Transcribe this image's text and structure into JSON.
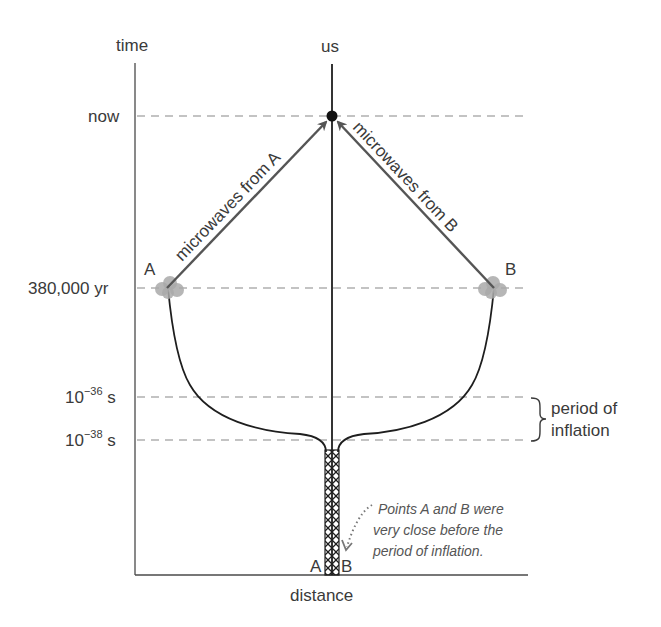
{
  "axes": {
    "y_label": "time",
    "x_label": "distance",
    "observer_label": "us"
  },
  "time_levels": [
    {
      "id": "now",
      "label": "now",
      "y": 116
    },
    {
      "id": "recombination",
      "label": "380,000 yr",
      "y": 288
    },
    {
      "id": "inflation_end",
      "label_base": "10",
      "label_exp": "−36",
      "label_unit": " s",
      "y": 397
    },
    {
      "id": "inflation_start",
      "label_base": "10",
      "label_exp": "−38",
      "label_unit": " s",
      "y": 440
    }
  ],
  "points": {
    "a_label": "A",
    "b_label": "B",
    "a_bottom_label": "A",
    "b_bottom_label": "B"
  },
  "rays": {
    "from_a": "microwaves from A",
    "from_b": "microwaves from B"
  },
  "bracket": {
    "line1": "period of",
    "line2": "inflation"
  },
  "annotation": {
    "line1": "Points A and B were",
    "line2": "very close before the",
    "line3": "period of inflation."
  },
  "colors": {
    "dashed_lines": "#b0b0b0",
    "worldlines": "#1e1e1e",
    "rays": "#555555",
    "clouds": "#a9a9a9",
    "text": "#3a3a3a"
  }
}
